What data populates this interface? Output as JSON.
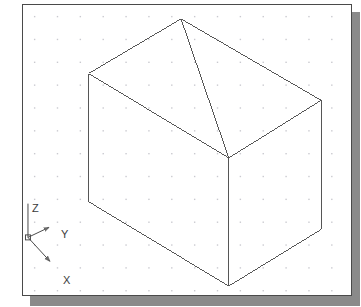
{
  "app": {
    "title": "CAD Isometric Viewport",
    "background_color": "#ffffff",
    "frame_border_color": "#4a4a4a",
    "shadow_color": "#8a8a8a"
  },
  "viewport": {
    "x": 22,
    "y": 4,
    "width": 330,
    "height": 292
  },
  "grid": {
    "visible": true,
    "style": "dots",
    "spacing_px": 23,
    "origin_x": 11,
    "origin_y": 11,
    "dot_color": "#c9c9cf",
    "dot_size_px": 1.4
  },
  "model": {
    "name": "isometric-wireframe-box",
    "line_color": "#555555",
    "line_width": 1,
    "description": "Isometric wireframe rectangular box viewed from above-front, showing three visible faces and interior back edges.",
    "vertices": {
      "top_back": [
        159,
        14
      ],
      "top_left": [
        66,
        69
      ],
      "top_right": [
        300,
        96
      ],
      "top_front": [
        207,
        154
      ],
      "bottom_left": [
        66,
        198
      ],
      "bottom_right": [
        300,
        226
      ],
      "bottom_front": [
        207,
        283
      ]
    },
    "edges": [
      [
        "top_back",
        "top_left"
      ],
      [
        "top_back",
        "top_right"
      ],
      [
        "top_left",
        "top_front"
      ],
      [
        "top_right",
        "top_front"
      ],
      [
        "top_back",
        "top_front"
      ],
      [
        "top_left",
        "bottom_left"
      ],
      [
        "top_right",
        "bottom_right"
      ],
      [
        "top_front",
        "bottom_front"
      ],
      [
        "bottom_left",
        "bottom_front"
      ],
      [
        "bottom_right",
        "bottom_front"
      ]
    ]
  },
  "ucs_icon": {
    "name": "ucs-axis-indicator",
    "origin": [
      5,
      234
    ],
    "color": "#4a4a4a",
    "axes": [
      {
        "id": "z",
        "label": "Z",
        "label_x": 9,
        "label_y": 198,
        "tip_x": 5,
        "tip_y": 200,
        "arrow": false
      },
      {
        "id": "y",
        "label": "Y",
        "label_x": 38,
        "label_y": 224,
        "tip_x": 26,
        "tip_y": 224,
        "arrow": true
      },
      {
        "id": "x",
        "label": "X",
        "label_x": 40,
        "label_y": 270,
        "tip_x": 27,
        "tip_y": 258,
        "arrow": true
      }
    ]
  }
}
